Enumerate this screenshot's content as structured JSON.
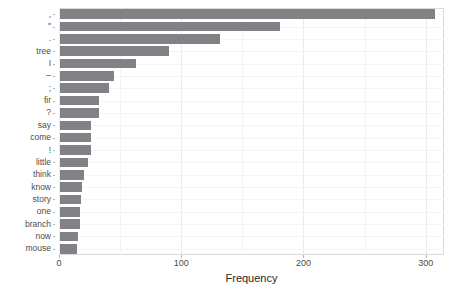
{
  "chart_data": {
    "type": "bar",
    "orientation": "horizontal",
    "title": "",
    "xlabel": "Frequency",
    "ylabel": "",
    "xlim": [
      0,
      315
    ],
    "xticks": [
      0,
      100,
      200,
      300
    ],
    "xticklabels": [
      "0",
      "100",
      "200",
      "300"
    ],
    "grid": true,
    "legend": null,
    "categories": [
      ",",
      "\"",
      ".",
      "tree",
      "I",
      "–",
      ";",
      "fir",
      "?",
      "say",
      "come",
      "!",
      "little",
      "think",
      "know",
      "story",
      "one",
      "branch",
      "now",
      "mouse"
    ],
    "values": [
      307,
      180,
      131,
      89,
      62,
      44,
      40,
      32,
      32,
      25,
      25,
      25,
      23,
      20,
      18,
      17,
      16,
      16,
      15,
      14
    ],
    "bar_color": "#808285",
    "panel_background": "#ffffff",
    "gridline_color": "#ebebeb"
  },
  "axes": {
    "x_title": "Frequency"
  }
}
